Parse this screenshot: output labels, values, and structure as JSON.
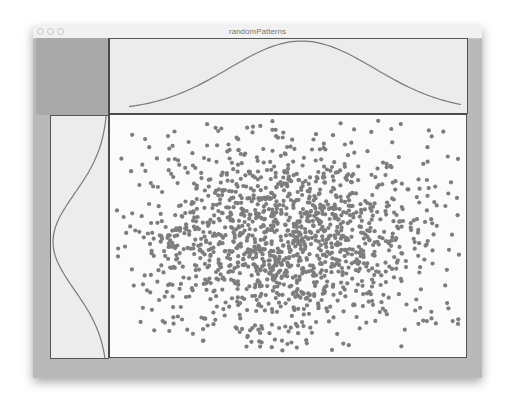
{
  "window": {
    "title": "randomPatterns",
    "controls": [
      "close",
      "minimize",
      "zoom"
    ]
  },
  "colors": {
    "chrome": "#b9b9b9",
    "panel_bg": "#ececec",
    "plot_bg": "#fbfbfb",
    "axis": "#4a4a4a",
    "curve": "#7a7a7a",
    "points": "#7d7d7d"
  },
  "chart_data": [
    {
      "type": "scatter",
      "title": "",
      "xlabel": "",
      "ylabel": "",
      "grid": false,
      "legend": null,
      "description": "~1500 points drawn from a 2D Gaussian, centered in plot area, wider horizontally than vertically",
      "n_points": 1500,
      "distribution": {
        "mean_x": 0.5,
        "mean_y": 0.5,
        "sd_x": 0.22,
        "sd_y": 0.21
      },
      "point_radius": 2.1,
      "seed": 7
    },
    {
      "type": "line",
      "title": "",
      "description": "Marginal density of x (top panel), Gaussian bell curve",
      "orientation": "horizontal",
      "mean": 0.52,
      "sd": 0.22
    },
    {
      "type": "line",
      "title": "",
      "description": "Marginal density of y (left panel), Gaussian bell curve rotated, peak pointing left",
      "orientation": "vertical",
      "mean": 0.52,
      "sd": 0.2
    }
  ]
}
